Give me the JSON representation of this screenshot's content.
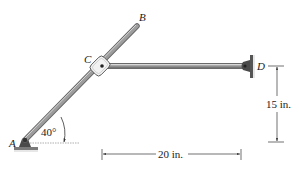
{
  "figure": {
    "points": {
      "A": {
        "label": "A"
      },
      "B": {
        "label": "B"
      },
      "C": {
        "label": "C"
      },
      "D": {
        "label": "D"
      }
    },
    "angle": {
      "label": "40°",
      "value_deg": 40
    },
    "dimensions": {
      "vertical": {
        "label": "15 in.",
        "value": 15,
        "unit": "in."
      },
      "horizontal": {
        "label": "20 in.",
        "value": 20,
        "unit": "in."
      }
    },
    "colors": {
      "rod_fill": "#a9a9a9",
      "rod_edge": "#6b6b6b",
      "support": "#555555",
      "dimension_line": "#333333"
    }
  }
}
